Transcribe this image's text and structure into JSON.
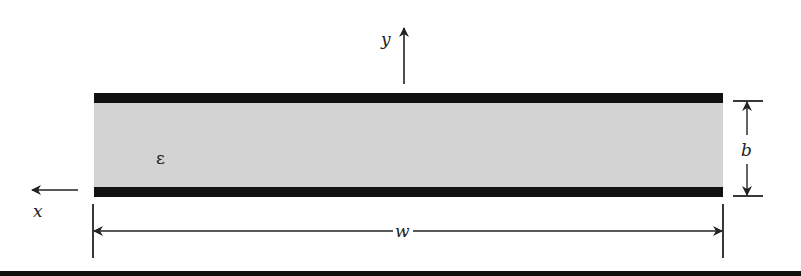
{
  "diagram": {
    "title": "",
    "labels": {
      "y_axis": "y",
      "x_axis": "x",
      "permittivity": "ε",
      "plate_separation": "b",
      "plate_width": "w"
    },
    "colors": {
      "plate": "#111111",
      "dielectric": "#d3d3d3",
      "line": "#222222",
      "background": "#ffffff"
    }
  }
}
